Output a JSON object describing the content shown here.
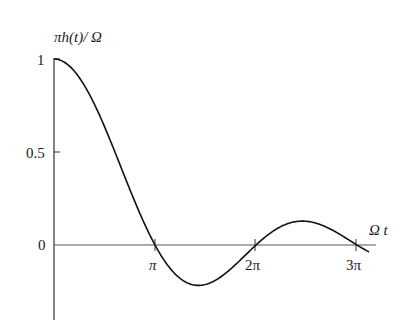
{
  "chart_data": {
    "type": "line",
    "title": "",
    "ylabel": "πh(t)/ Ω",
    "xlabel": "Ω t",
    "function": "sin(Ωt)/(Ωt)",
    "x_ticks": [
      {
        "value": 3.14159,
        "label": "π"
      },
      {
        "value": 6.28319,
        "label": "2π"
      },
      {
        "value": 9.42478,
        "label": "3π"
      }
    ],
    "y_ticks": [
      {
        "value": 1,
        "label": "1"
      },
      {
        "value": 0.5,
        "label": "0.5"
      },
      {
        "value": 0,
        "label": "0"
      }
    ],
    "xlim": [
      0,
      10.0
    ],
    "ylim": [
      -0.4,
      1.0
    ],
    "grid": false,
    "legend": null,
    "series": [
      {
        "name": "πh(t)/Ω",
        "x": [
          0,
          0.5,
          1.0,
          1.5,
          2.0,
          2.5,
          3.0,
          3.1416,
          3.5,
          4.0,
          4.4934,
          5.0,
          5.5,
          6.0,
          6.2832,
          6.5,
          7.0,
          7.7253,
          8.0,
          8.5,
          9.0,
          9.4248,
          9.8
        ],
        "values": [
          1.0,
          0.959,
          0.841,
          0.665,
          0.455,
          0.239,
          0.047,
          0.0,
          -0.1,
          -0.189,
          -0.217,
          -0.192,
          -0.128,
          -0.047,
          0.0,
          0.033,
          0.094,
          0.128,
          0.124,
          0.094,
          0.046,
          0.0,
          -0.039
        ]
      }
    ]
  },
  "labels": {
    "ylabel_text": "πh(t)/ Ω",
    "xlabel_text": "Ω t",
    "y1": "1",
    "y05": "0.5",
    "y0": "0",
    "xpi": "π",
    "x2pi": "2π",
    "x3pi": "3π"
  }
}
